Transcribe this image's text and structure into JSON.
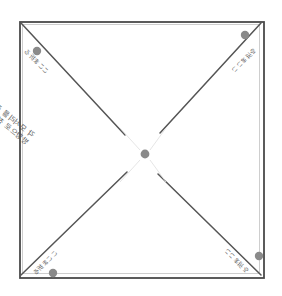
{
  "figure": {
    "background_color": "#ffffff",
    "paper": {
      "outline_color": "#4a4a4a",
      "fill_color": "#ffffff",
      "left": 19,
      "top": 21,
      "right": 263,
      "bottom": 277
    },
    "crease_color": "#555555",
    "dot_color": "#8a8a8a"
  },
  "dots": [
    {
      "name": "dot-top-left",
      "cx": 37,
      "cy": 51,
      "r": 4.2
    },
    {
      "name": "dot-top-right",
      "cx": 245,
      "cy": 35,
      "r": 4.2
    },
    {
      "name": "dot-bottom-left",
      "cx": 53,
      "cy": 273,
      "r": 4.2
    },
    {
      "name": "dot-bottom-right",
      "cx": 259,
      "cy": 256,
      "r": 4.2
    },
    {
      "name": "dot-center",
      "cx": 145,
      "cy": 154,
      "r": 4.4
    }
  ],
  "creases": [
    {
      "name": "crease-top-left-to-center",
      "x1": 21,
      "y1": 23,
      "x2": 125,
      "y2": 135
    },
    {
      "name": "crease-top-right-to-center",
      "x1": 261,
      "y1": 23,
      "x2": 160,
      "y2": 133
    },
    {
      "name": "crease-bottom-left-to-center",
      "x1": 21,
      "y1": 275,
      "x2": 127,
      "y2": 172
    },
    {
      "name": "crease-bottom-right-to-center",
      "x1": 261,
      "y1": 275,
      "x2": 158,
      "y2": 174
    }
  ],
  "labels": {
    "corner_top_left": {
      "text": "ここま折る",
      "x": 48,
      "y": 68,
      "rotation": 45
    },
    "corner_top_right": {
      "text": "ここま折る",
      "x": 233,
      "y": 67,
      "rotation": 135
    },
    "corner_bottom_left": {
      "text": "ここま折る",
      "x": 56,
      "y": 247,
      "rotation": -45
    },
    "corner_bottom_right": {
      "text": "ここま折る",
      "x": 225,
      "y": 245,
      "rotation": -135
    }
  },
  "center_note": {
    "line_1": "각 모서리를 중앙의 점",
    "line_2": "방향으로 접어 줍니다",
    "x": 30,
    "y": 131,
    "rotation": 38
  }
}
